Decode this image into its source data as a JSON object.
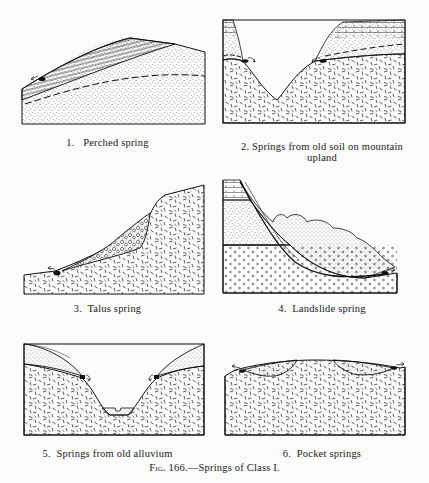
{
  "figure": {
    "label": "Fig. 166.",
    "title": "Springs of Class I.",
    "full_caption": "Fig. 166.—Springs of Class I."
  },
  "panels": [
    {
      "number": "1.",
      "caption": "Perched spring",
      "layers": [
        "horizontally lined permeable bed",
        "stippled sandstone",
        "dashed water table"
      ],
      "springs": 1
    },
    {
      "number": "2.",
      "caption": "Springs from old soil on mountain",
      "caption_line2": "upland",
      "layers": [
        "bedded cap rock",
        "stippled old soil",
        "dash-pattern crystalline rock"
      ],
      "springs": 2
    },
    {
      "number": "3.",
      "caption": "Talus spring",
      "layers": [
        "talus (coarse fragments)",
        "dash-pattern crystalline rock"
      ],
      "springs": 1
    },
    {
      "number": "4.",
      "caption": "Landslide spring",
      "layers": [
        "bedded strata",
        "fine stippled sandstone",
        "coarse dotted conglomerate",
        "landslide blocks"
      ],
      "springs": 1
    },
    {
      "number": "5.",
      "caption": "Springs from old alluvium",
      "layers": [
        "stippled old alluvium",
        "dash-pattern crystalline rock",
        "valley floor alluvium"
      ],
      "springs": 2
    },
    {
      "number": "6.",
      "caption": "Pocket springs",
      "layers": [
        "stippled pocket deposits",
        "dash-pattern crystalline rock"
      ],
      "springs": 2
    }
  ]
}
